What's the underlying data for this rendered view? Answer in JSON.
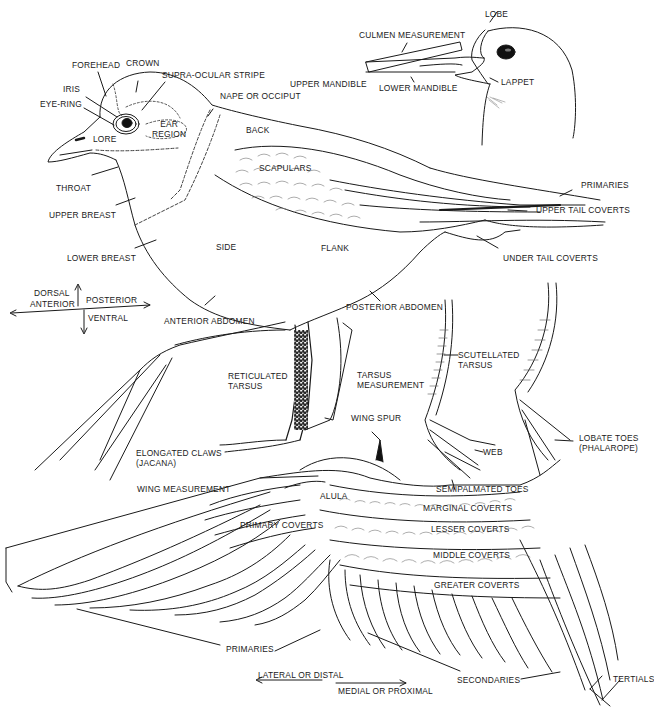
{
  "diagram": {
    "head_labels": {
      "forehead": "FOREHEAD",
      "crown": "CROWN",
      "iris": "IRIS",
      "eye_ring": "EYE-RING",
      "supra_ocular_stripe": "SUPRA-OCULAR STRIPE",
      "nape": "NAPE OR OCCIPUT",
      "ear_region": "EAR\nREGION",
      "lore": "LORE"
    },
    "bill_labels": {
      "lobe": "LOBE",
      "culmen": "CULMEN MEASUREMENT",
      "upper_mandible": "UPPER MANDIBLE",
      "lower_mandible": "LOWER MANDIBLE",
      "lappet": "LAPPET"
    },
    "body_labels": {
      "back": "BACK",
      "scapulars": "SCAPULARS",
      "throat": "THROAT",
      "upper_breast": "UPPER BREAST",
      "lower_breast": "LOWER BREAST",
      "side": "SIDE",
      "flank": "FLANK",
      "primaries_tail": "PRIMARIES",
      "upper_tail_coverts": "UPPER TAIL COVERTS",
      "under_tail_coverts": "UNDER TAIL COVERTS",
      "anterior_abdomen": "ANTERIOR ABDOMEN",
      "posterior_abdomen": "POSTERIOR ABDOMEN"
    },
    "orientation": {
      "dorsal": "DORSAL",
      "anterior": "ANTERIOR",
      "posterior": "POSTERIOR",
      "ventral": "VENTRAL"
    },
    "leg_labels": {
      "reticulated_tarsus": "RETICULATED\nTARSUS",
      "tarsus_measurement": "TARSUS\nMEASUREMENT",
      "scutellated_tarsus": "SCUTELLATED\nTARSUS",
      "elongated_claws": "ELONGATED CLAWS\n(JACANA)",
      "web": "WEB",
      "semipalmated_toes": "SEMIPALMATED TOES",
      "lobate_toes": "LOBATE TOES\n(PHALAROPE)"
    },
    "wing_labels": {
      "wing_spur": "WING SPUR",
      "wing_measurement": "WING MEASUREMENT",
      "alula": "ALULA",
      "primary_coverts": "PRIMARY COVERTS",
      "marginal_coverts": "MARGINAL COVERTS",
      "lesser_coverts": "LESSER COVERTS",
      "middle_coverts": "MIDDLE COVERTS",
      "greater_coverts": "GREATER COVERTS",
      "primaries": "PRIMARIES",
      "secondaries": "SECONDARIES",
      "tertials": "TERTIALS",
      "lateral": "LATERAL OR DISTAL",
      "medial": "MEDIAL OR PROXIMAL"
    },
    "colors": {
      "ink": "#1a1a1a",
      "paper": "#ffffff"
    }
  }
}
